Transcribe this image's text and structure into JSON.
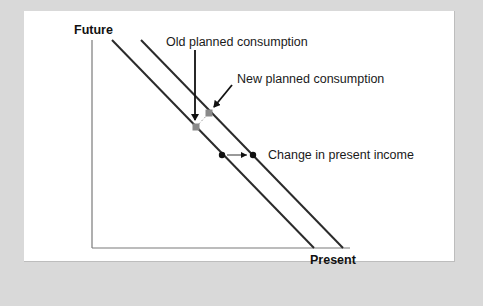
{
  "diagram": {
    "axes": {
      "y_label": "Future",
      "x_label": "Present"
    },
    "lines": [
      {
        "name": "original-budget-line",
        "x1": 112,
        "y1": 40,
        "x2": 314,
        "y2": 248
      },
      {
        "name": "new-budget-line",
        "x1": 141,
        "y1": 40,
        "x2": 343,
        "y2": 248
      }
    ],
    "annotations": {
      "old_planned": "Old planned consumption",
      "new_planned": "New planned consumption",
      "income_change": "Change in present income"
    },
    "points": {
      "old_planned": {
        "x": 196,
        "y": 127,
        "color": "#8a8a8a"
      },
      "new_planned": {
        "x": 209,
        "y": 113,
        "color": "#8a8a8a"
      },
      "income_before": {
        "x": 222,
        "y": 155,
        "color": "#111111"
      },
      "income_after": {
        "x": 253,
        "y": 155,
        "color": "#111111"
      }
    },
    "colors": {
      "background": "#d9d9d9",
      "panel": "#ffffff",
      "line": "#2b2b2b",
      "axis": "#7a7a7a"
    }
  }
}
